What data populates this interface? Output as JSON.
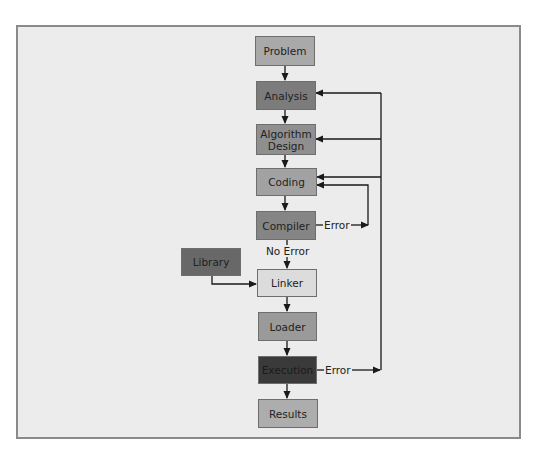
{
  "diagram": {
    "type": "flowchart",
    "title": "",
    "nodes": [
      {
        "id": "problem",
        "label": "Problem",
        "fill": "#a9a9a9"
      },
      {
        "id": "analysis",
        "label": "Analysis",
        "fill": "#7c7c7c"
      },
      {
        "id": "algorithm",
        "label": "Algorithm Design",
        "fill": "#8f8f8f"
      },
      {
        "id": "coding",
        "label": "Coding",
        "fill": "#a2a2a2"
      },
      {
        "id": "compiler",
        "label": "Compiler",
        "fill": "#858585"
      },
      {
        "id": "library",
        "label": "Library",
        "fill": "#686868"
      },
      {
        "id": "linker",
        "label": "Linker",
        "fill": "#dcdcdc"
      },
      {
        "id": "loader",
        "label": "Loader",
        "fill": "#9a9a9a"
      },
      {
        "id": "execution",
        "label": "Execution",
        "fill": "#3a3a3a"
      },
      {
        "id": "results",
        "label": "Results",
        "fill": "#adadad"
      }
    ],
    "edges": [
      {
        "from": "problem",
        "to": "analysis",
        "label": ""
      },
      {
        "from": "analysis",
        "to": "algorithm",
        "label": ""
      },
      {
        "from": "algorithm",
        "to": "coding",
        "label": ""
      },
      {
        "from": "coding",
        "to": "compiler",
        "label": ""
      },
      {
        "from": "compiler",
        "to": "coding",
        "label": "Error"
      },
      {
        "from": "compiler",
        "to": "linker",
        "label": "No Error"
      },
      {
        "from": "library",
        "to": "linker",
        "label": ""
      },
      {
        "from": "linker",
        "to": "loader",
        "label": ""
      },
      {
        "from": "loader",
        "to": "execution",
        "label": ""
      },
      {
        "from": "execution",
        "to": "results",
        "label": ""
      },
      {
        "from": "execution",
        "to": "analysis",
        "label": "Error"
      },
      {
        "from": "execution",
        "to": "algorithm",
        "label": "Error"
      },
      {
        "from": "execution",
        "to": "coding",
        "label": "Error"
      }
    ],
    "edge_labels": {
      "compiler_error": "Error",
      "no_error": "No Error",
      "execution_error": "Error"
    }
  }
}
